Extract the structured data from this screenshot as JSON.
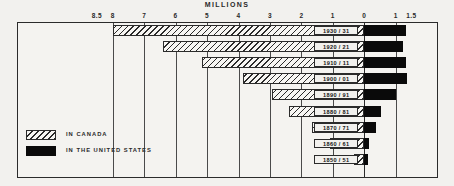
{
  "chart_data": {
    "type": "bar",
    "orientation": "horizontal",
    "title": "MILLIONS",
    "subtitle": "",
    "xlabel": "MILLIONS",
    "ylabel": "",
    "grid": true,
    "legend_position": "bottom-left",
    "axis": {
      "note": "Diverging axis: values left of zero are Canada (millions), right of zero are United States (millions)",
      "zero_at": "0",
      "left_max": 8.5,
      "right_max": 1.5,
      "tick_labels": [
        "8.5",
        "8",
        "7",
        "6",
        "5",
        "4",
        "3",
        "2",
        "1",
        "0",
        "1",
        "1.5"
      ],
      "tick_values": [
        -8.5,
        -8,
        -7,
        -6,
        -5,
        -4,
        -3,
        -2,
        -1,
        0,
        1,
        1.5
      ]
    },
    "categories": [
      "1930 / 31",
      "1920 / 21",
      "1910 / 11",
      "1900 / 01",
      "1890 / 91",
      "1880 / 81",
      "1870 / 71",
      "1860 / 61",
      "1850 / 51"
    ],
    "series": [
      {
        "name": "IN CANADA",
        "style": "hatched",
        "color": "#f7f6f3",
        "values": [
          8.0,
          6.4,
          5.15,
          3.85,
          2.95,
          2.4,
          1.65,
          1.1,
          0.32
        ]
      },
      {
        "name": "IN THE UNITED STATES",
        "style": "solid",
        "color": "#0a0a0a",
        "values": [
          1.34,
          1.22,
          1.33,
          1.36,
          1.0,
          0.52,
          0.38,
          0.15,
          0.12
        ]
      }
    ]
  },
  "legend": {
    "items": [
      {
        "label": "IN CANADA",
        "style": "hatch"
      },
      {
        "label": "IN THE UNITED STATES",
        "style": "solid"
      }
    ]
  }
}
